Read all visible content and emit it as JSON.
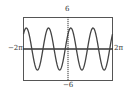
{
  "chart_data": {
    "type": "line",
    "title": "",
    "function": "y = 4 sin(2x + pi/4)",
    "xlabel": "",
    "ylabel": "",
    "xlim": [
      -6.2832,
      6.2832
    ],
    "ylim": [
      -6,
      6
    ],
    "x_tick_labels": {
      "min": "-2π",
      "max": "2π"
    },
    "y_tick_labels": {
      "min": "-6",
      "max": "6"
    },
    "amplitude": 4,
    "period": 3.1416,
    "phase": 0.7854,
    "grid": false,
    "series": [
      {
        "name": "curve",
        "color": "#444444"
      }
    ]
  },
  "labels": {
    "ymax": "6",
    "ymin": "−6",
    "xmin": "−2π",
    "xmax": "2π"
  }
}
